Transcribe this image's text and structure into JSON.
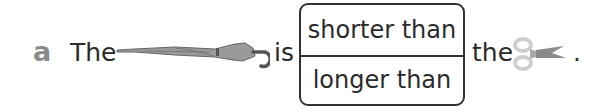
{
  "exercise": {
    "label": "a",
    "sentence": {
      "word_before": "The",
      "object_1": "umbrella-icon",
      "verb": "is",
      "word_after": "the",
      "object_2": "scissors-icon",
      "end_punct": "."
    },
    "choices": [
      {
        "label": "shorter than"
      },
      {
        "label": "longer than"
      }
    ]
  },
  "colors": {
    "text": "#2b2b2b",
    "label": "#8a8a8a",
    "umbrella": "#8c8c8c",
    "scissors_handle": "#cfcfcf",
    "scissors_blade": "#8a8a8a"
  }
}
